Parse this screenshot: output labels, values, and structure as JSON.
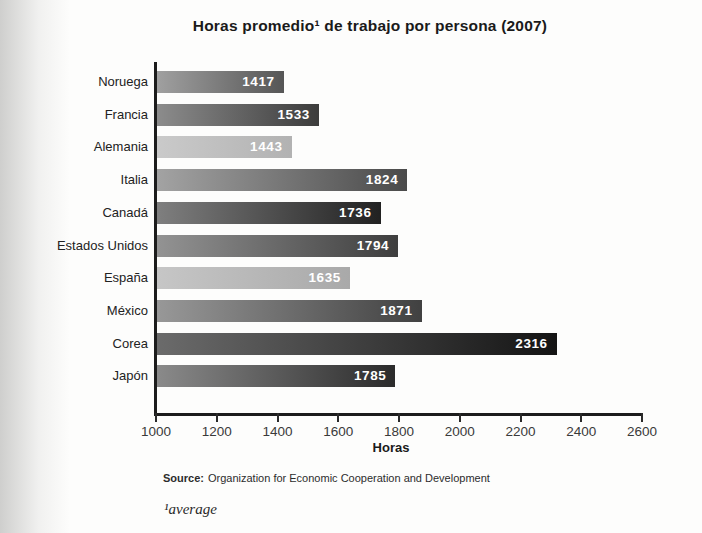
{
  "title": "Horas promedio¹ de trabajo por persona (2007)",
  "chart_data": {
    "type": "bar",
    "orientation": "horizontal",
    "title": "Horas promedio¹ de trabajo por persona (2007)",
    "categories": [
      "Noruega",
      "Francia",
      "Alemania",
      "Italia",
      "Canadá",
      "Estados Unidos",
      "España",
      "México",
      "Corea",
      "Japón"
    ],
    "values": [
      1417,
      1533,
      1443,
      1824,
      1736,
      1794,
      1635,
      1871,
      2316,
      1785
    ],
    "xlabel": "Horas",
    "ylabel": "",
    "xlim": [
      1000,
      2600
    ],
    "xticks": [
      1000,
      1200,
      1400,
      1600,
      1800,
      2000,
      2200,
      2400,
      2600
    ],
    "grid": false,
    "legend": "none",
    "value_label_color": "#ffffff",
    "axis_color": "#1c1c1c",
    "bar_gradients": [
      {
        "from": "#a0a0a0",
        "to": "#565656"
      },
      {
        "from": "#8c8c8c",
        "to": "#3c3c3c"
      },
      {
        "from": "#cacaca",
        "to": "#b2b2b2"
      },
      {
        "from": "#a3a3a3",
        "to": "#4a4a4a"
      },
      {
        "from": "#7f7f7f",
        "to": "#212121"
      },
      {
        "from": "#939393",
        "to": "#3e3e3e"
      },
      {
        "from": "#c6c6c6",
        "to": "#a9a9a9"
      },
      {
        "from": "#989898",
        "to": "#414141"
      },
      {
        "from": "#6b6b6b",
        "to": "#141414"
      },
      {
        "from": "#8a8a8a",
        "to": "#2b2b2b"
      }
    ]
  },
  "source": {
    "label": "Source:",
    "text": "Organization for Economic Cooperation and Development"
  },
  "footnote": "¹average"
}
